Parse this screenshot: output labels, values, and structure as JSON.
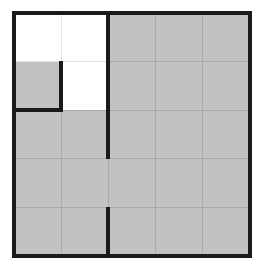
{
  "figure": {
    "title": "Shaded grid region diagram",
    "description": "A square 5-by-5 grid. An L-shaped region in the upper-left corner is left unshaded (white); the remainder of the square is shaded gray. Heavy black strokes outline the square border, the unshaded region, and a partial interior vertical divider.",
    "type": "grid-region-diagram"
  },
  "canvas": {
    "width": 259,
    "height": 268,
    "background": "#ffffff"
  },
  "colors": {
    "background": "#ffffff",
    "shaded_fill": "#c2c2c2",
    "unshaded_fill": "#ffffff",
    "minor_gridline": "#a9a9a9",
    "faint_gridline": "#e2e2e2",
    "heavy_stroke": "#1a1a1a"
  },
  "geometry": {
    "outer_left": 14,
    "outer_top": 13,
    "outer_right": 250,
    "outer_bottom": 256,
    "columns": 5,
    "rows": 5,
    "cell_width": 47.2,
    "cell_height": 48.6,
    "column_x": [
      14,
      61.2,
      108.4,
      155.6,
      202.8,
      250
    ],
    "row_y": [
      13,
      61.6,
      110.2,
      158.8,
      207.4,
      256
    ],
    "heavy_stroke_width": 4,
    "minor_stroke_width": 1.2,
    "faint_stroke_width": 1
  },
  "regions": {
    "unshaded": {
      "name": "white-L-region",
      "fill": "#ffffff",
      "cells": [
        {
          "col": 0,
          "row": 0
        },
        {
          "col": 1,
          "row": 0
        },
        {
          "col": 0,
          "row": 1
        }
      ],
      "outline_points": "14,13 108.4,13 108.4,110.2 61.2,110.2 61.2,61.6 14,61.6"
    },
    "shaded": {
      "name": "gray-shaded-region",
      "fill": "#c2c2c2",
      "cell_count": 22,
      "description": "All grid cells except the three cells of the unshaded L-region."
    }
  },
  "heavy_strokes": [
    {
      "name": "outer-border-top",
      "x1": 14,
      "y1": 13,
      "x2": 250,
      "y2": 13
    },
    {
      "name": "outer-border-right",
      "x1": 250,
      "y1": 13,
      "x2": 250,
      "y2": 256
    },
    {
      "name": "outer-border-bottom",
      "x1": 250,
      "y1": 256,
      "x2": 14,
      "y2": 256
    },
    {
      "name": "outer-border-left",
      "x1": 14,
      "y1": 256,
      "x2": 14,
      "y2": 13
    },
    {
      "name": "region-vertical-divider-upper",
      "x1": 108.4,
      "y1": 13,
      "x2": 108.4,
      "y2": 158.8
    },
    {
      "name": "region-vertical-divider-lower",
      "x1": 108.4,
      "y1": 207.4,
      "x2": 108.4,
      "y2": 256
    },
    {
      "name": "region-notch-vertical",
      "x1": 61.2,
      "y1": 61.6,
      "x2": 61.2,
      "y2": 110.2
    },
    {
      "name": "region-notch-horizontal",
      "x1": 14,
      "y1": 110.2,
      "x2": 61.2,
      "y2": 110.2
    }
  ],
  "minor_gridlines": {
    "vertical_x": [
      61.2,
      108.4,
      155.6,
      202.8
    ],
    "horizontal_y": [
      61.6,
      110.2,
      158.8,
      207.4
    ]
  },
  "labels": {
    "figure_caption": "",
    "unshaded_label": "unshaded region",
    "shaded_label": "shaded region"
  }
}
